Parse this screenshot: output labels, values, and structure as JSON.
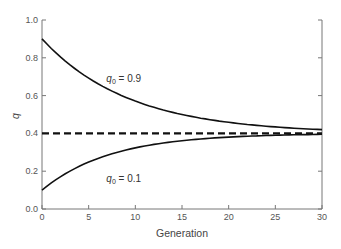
{
  "chart_data": {
    "type": "line",
    "title": "",
    "xlabel": "Generation",
    "ylabel": "q",
    "xlim": [
      0,
      30
    ],
    "ylim": [
      0.0,
      1.0
    ],
    "x_ticks": [
      "0",
      "5",
      "10",
      "15",
      "20",
      "25",
      "30"
    ],
    "y_ticks": [
      "0.0",
      "0.2",
      "0.4",
      "0.6",
      "0.8",
      "1.0"
    ],
    "grid": false,
    "legend": "none (inline annotations)",
    "x": [
      0,
      2,
      4,
      6,
      8,
      10,
      12,
      14,
      16,
      18,
      20,
      22,
      24,
      26,
      28,
      30
    ],
    "series": [
      {
        "name": "q0 = 0.9",
        "style": "solid",
        "values": [
          0.9,
          0.8,
          0.73,
          0.66,
          0.61,
          0.57,
          0.54,
          0.51,
          0.49,
          0.47,
          0.46,
          0.45,
          0.44,
          0.43,
          0.425,
          0.42
        ]
      },
      {
        "name": "q0 = 0.1",
        "style": "solid",
        "values": [
          0.1,
          0.16,
          0.21,
          0.25,
          0.29,
          0.31,
          0.33,
          0.35,
          0.36,
          0.37,
          0.38,
          0.385,
          0.39,
          0.39,
          0.395,
          0.395
        ]
      },
      {
        "name": "equilibrium",
        "style": "dashed",
        "values": [
          0.4,
          0.4,
          0.4,
          0.4,
          0.4,
          0.4,
          0.4,
          0.4,
          0.4,
          0.4,
          0.4,
          0.4,
          0.4,
          0.4,
          0.4,
          0.4
        ]
      }
    ],
    "annotations": [
      {
        "text_var": "q",
        "text_sub": "0",
        "text_rest": " = 0.9",
        "x": 7,
        "y": 0.69
      },
      {
        "text_var": "q",
        "text_sub": "0",
        "text_rest": " = 0.1",
        "x": 7,
        "y": 0.16
      }
    ]
  },
  "colors": {
    "axis": "#777777",
    "line": "#111111",
    "text": "#444444"
  }
}
